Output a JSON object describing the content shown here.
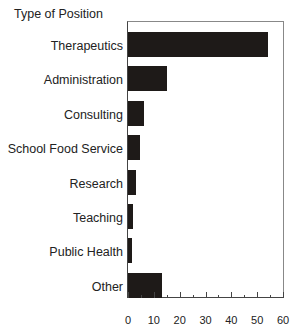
{
  "chart_data": {
    "type": "bar",
    "orientation": "horizontal",
    "title": "",
    "ylabel": "Type of Position",
    "xlabel": "",
    "categories": [
      "Therapeutics",
      "Administration",
      "Consulting",
      "School Food Service",
      "Research",
      "Teaching",
      "Public Health",
      "Other"
    ],
    "values": [
      54,
      15,
      6,
      4.5,
      3,
      2,
      1.5,
      13
    ],
    "xlim": [
      0,
      60
    ],
    "xticks": [
      "0",
      "10",
      "20",
      "30",
      "40",
      "50",
      "60"
    ],
    "grid": false,
    "legend": null,
    "bar_color": "#1e1a18"
  }
}
